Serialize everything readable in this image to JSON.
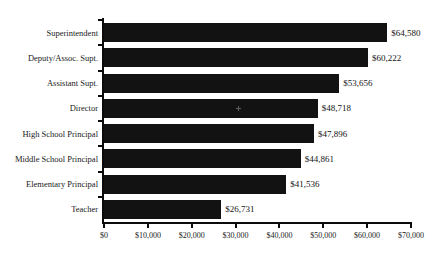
{
  "chart_data": {
    "type": "bar",
    "orientation": "horizontal",
    "title": "",
    "xlabel": "",
    "ylabel": "",
    "categories": [
      "Superintendent",
      "Deputy/Assoc. Supt.",
      "Assistant Supt.",
      "Director",
      "High School Principal",
      "Middle School Principal",
      "Elementary Principal",
      "Teacher"
    ],
    "values": [
      64580,
      60222,
      53656,
      48718,
      47896,
      44861,
      41536,
      26731
    ],
    "value_labels": [
      "$64,580",
      "$60,222",
      "$53,656",
      "$48,718",
      "$47,896",
      "$44,861",
      "$41,536",
      "$26,731"
    ],
    "xlim": [
      0,
      70000
    ],
    "xticks": [
      0,
      10000,
      20000,
      30000,
      40000,
      50000,
      60000,
      70000
    ],
    "xtick_labels": [
      "$0",
      "$10,000",
      "$20,000",
      "$30,000",
      "$40,000",
      "$50,000",
      "$60,000",
      "$70,000"
    ],
    "grid": false,
    "legend": false,
    "bar_color": "#121212",
    "axis_color": "#0b0b0b",
    "background_color": "#ffffff"
  }
}
